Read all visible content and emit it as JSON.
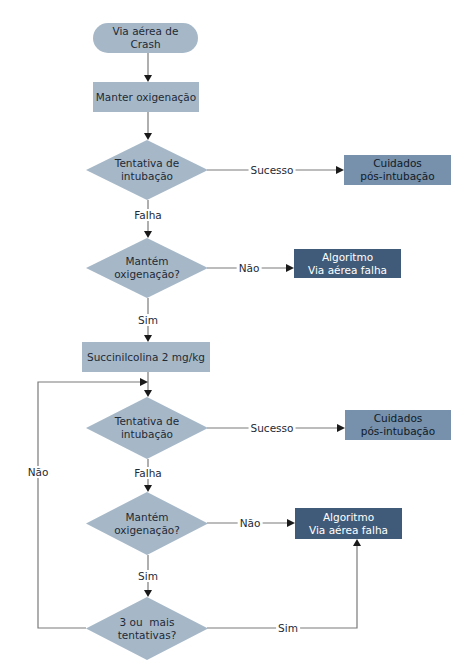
{
  "flowchart": {
    "start": {
      "line1": "Via aérea de",
      "line2": "Crash"
    },
    "step_oxygenate": "Manter oxigenação",
    "decision_intubation_1": {
      "line1": "Tentativa de",
      "line2": "intubação"
    },
    "outcome_post_intubation_1": {
      "line1": "Cuidados",
      "line2": "pós-intubação"
    },
    "decision_oxygenation_1": {
      "line1": "Mantém",
      "line2": "oxigenação?"
    },
    "outcome_failed_airway_1": {
      "line1": "Algoritmo",
      "line2": "Via aérea falha"
    },
    "step_succinylcholine": "Succinilcolina 2 mg/kg",
    "decision_intubation_2": {
      "line1": "Tentativa de",
      "line2": "intubação"
    },
    "outcome_post_intubation_2": {
      "line1": "Cuidados",
      "line2": "pós-intubação"
    },
    "decision_oxygenation_2": {
      "line1": "Mantém",
      "line2": "oxigenação?"
    },
    "outcome_failed_airway_2": {
      "line1": "Algoritmo",
      "line2": "Via aérea falha"
    },
    "decision_attempts": {
      "line1": "3 ou  mais",
      "line2": "tentativas?"
    },
    "edge_labels": {
      "success_1": "Sucesso",
      "fail_1": "Falha",
      "no_1": "Não",
      "yes_1": "Sim",
      "success_2": "Sucesso",
      "fail_2": "Falha",
      "no_2": "Não",
      "yes_2": "Sim",
      "loop_no": "Não",
      "attempts_yes": "Sim"
    }
  },
  "colors": {
    "node_fill": "#a6b8c8",
    "post_intubation_fill": "#7790ab",
    "failed_airway_fill": "#3f5b79",
    "connector": "#7a7a7a",
    "arrowhead": "#1a1a1a"
  }
}
